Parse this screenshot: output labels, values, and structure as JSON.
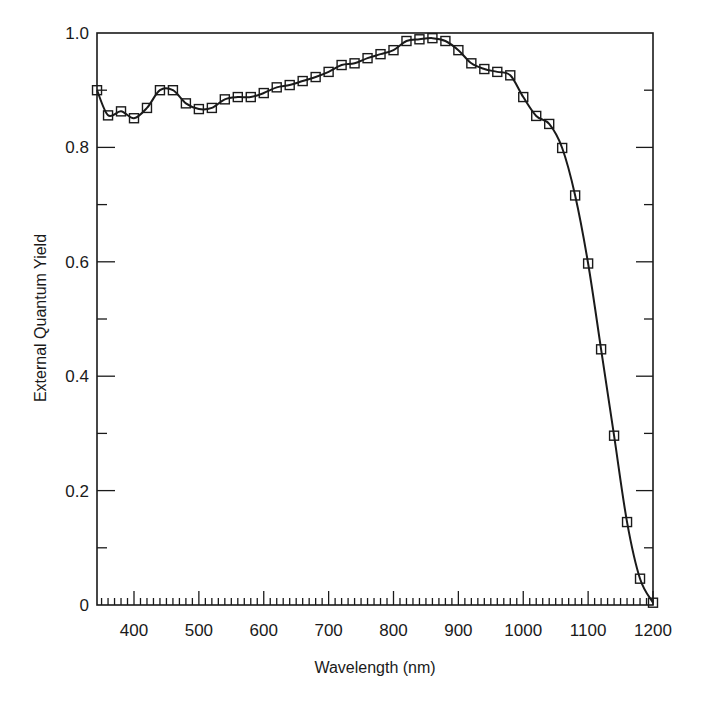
{
  "chart_data": {
    "type": "line",
    "title": "",
    "xlabel": "Wavelength (nm)",
    "ylabel": "External Quantum Yield",
    "xlim": [
      343,
      1200
    ],
    "ylim": [
      0,
      1.0
    ],
    "grid": false,
    "legend": null,
    "marker": "open-square",
    "line_color": "#1a1a1a",
    "x_ticks": [
      400,
      500,
      600,
      700,
      800,
      900,
      1000,
      1100,
      1200
    ],
    "x_tick_labels": [
      "400",
      "500",
      "600",
      "700",
      "800",
      "900",
      "1000",
      "1100",
      "1200"
    ],
    "x_minor_step": 10,
    "y_ticks": [
      0,
      0.2,
      0.4,
      0.6,
      0.8,
      1.0
    ],
    "y_tick_labels": [
      "0",
      "0.2",
      "0.4",
      "0.6",
      "0.8",
      "1.0"
    ],
    "y_minor_step": 0.1,
    "series": [
      {
        "name": "External Quantum Yield",
        "x": [
          343,
          360,
          380,
          400,
          420,
          440,
          460,
          480,
          500,
          520,
          540,
          560,
          580,
          600,
          620,
          640,
          660,
          680,
          700,
          720,
          740,
          760,
          780,
          800,
          820,
          840,
          860,
          880,
          900,
          920,
          940,
          960,
          980,
          1000,
          1020,
          1040,
          1060,
          1080,
          1100,
          1120,
          1140,
          1160,
          1180,
          1200
        ],
        "values": [
          0.9,
          0.856,
          0.863,
          0.851,
          0.869,
          0.9,
          0.9,
          0.877,
          0.867,
          0.869,
          0.884,
          0.888,
          0.888,
          0.895,
          0.905,
          0.909,
          0.916,
          0.923,
          0.932,
          0.944,
          0.947,
          0.956,
          0.963,
          0.97,
          0.986,
          0.989,
          0.991,
          0.986,
          0.97,
          0.947,
          0.937,
          0.932,
          0.926,
          0.888,
          0.855,
          0.841,
          0.799,
          0.716,
          0.597,
          0.447,
          0.296,
          0.145,
          0.046,
          0.004
        ]
      }
    ]
  },
  "layout": {
    "plot_left": 97,
    "plot_right": 653,
    "plot_top": 33,
    "plot_bottom": 605
  }
}
